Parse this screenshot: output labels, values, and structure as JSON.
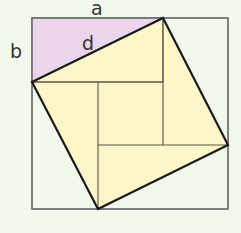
{
  "diagram": {
    "labels": {
      "a": "a",
      "b": "b",
      "d": "d"
    },
    "colors": {
      "background": "#f3f8ec",
      "rectangle_fill": "#ead5ec",
      "tilted_square_fill": "#fdf6c8",
      "outer_stroke": "#6b6b6b",
      "inner_stroke": "#5a5540",
      "tilted_stroke": "#1a1a1a",
      "label": "#333333"
    },
    "outer_square": {
      "x1": 32,
      "y1": 18,
      "x2": 228,
      "y2": 209
    },
    "rectangle_ab": {
      "x": 32,
      "y": 18,
      "width": 131,
      "height": 64
    },
    "tilted_square": [
      [
        32,
        82
      ],
      [
        163,
        18
      ],
      [
        228,
        145
      ],
      [
        98,
        209
      ]
    ],
    "inner_lines": [
      [
        32,
        82,
        163,
        82
      ],
      [
        98,
        82,
        98,
        209
      ],
      [
        163,
        18,
        163,
        145
      ],
      [
        98,
        145,
        228,
        145
      ]
    ]
  }
}
